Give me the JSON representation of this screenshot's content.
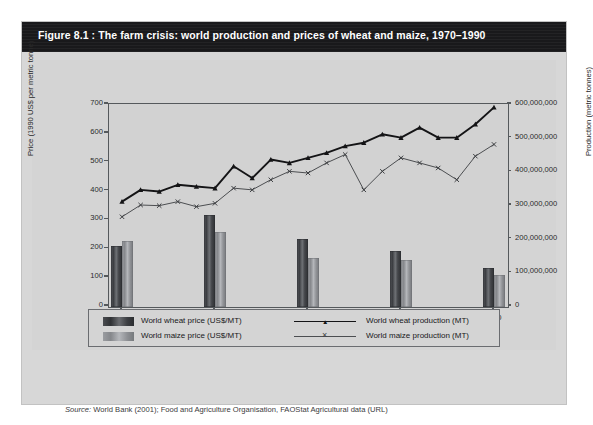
{
  "figure": {
    "number": "Figure 8.1 :",
    "caption": "The farm crisis: world production and prices of wheat and maize, 1970–1990",
    "source_label": "Source:",
    "source_text": "World Bank (2001); Food and Agriculture Organisation, FAOStat Agricultural data (URL)"
  },
  "legend": {
    "items": [
      {
        "label": "World wheat price (US$/MT)",
        "marker": "bar-dark",
        "color": "#3b3d41"
      },
      {
        "label": "World maize price (US$/MT)",
        "marker": "bar-light",
        "color": "#9b9da1"
      },
      {
        "label": "World wheat production (MT)",
        "marker": "line-triangle",
        "color": "#141416"
      },
      {
        "label": "World maize production (MT)",
        "marker": "line-x",
        "color": "#4c4e51"
      }
    ]
  },
  "chart_data": {
    "type": "bar",
    "title": "The farm crisis: world production and prices of wheat and maize, 1970–1990",
    "xlabel": "Year",
    "ylabel": "Price (1990 US$ per metric tonne)",
    "y2label": "Production (metric tonnes)",
    "xlim": [
      1969.3,
      1990.7
    ],
    "ylim": [
      0,
      700
    ],
    "y2lim": [
      0,
      600000000
    ],
    "yticks": [
      0,
      100,
      200,
      300,
      400,
      500,
      600,
      700
    ],
    "ytick_labels": [
      "0",
      "100",
      "200",
      "300",
      "400",
      "500",
      "600",
      "700"
    ],
    "y2ticks": [
      0,
      100000000,
      200000000,
      300000000,
      400000000,
      500000000,
      600000000
    ],
    "y2tick_labels": [
      "0",
      "100,000,000",
      "200,000,000",
      "300,000,000",
      "400,000,000",
      "500,000,000",
      "600,000,000"
    ],
    "xticks": [
      1970,
      1975,
      1980,
      1985,
      1990
    ],
    "xtick_labels": [
      "1970",
      "1975",
      "1980",
      "1985",
      "1990"
    ],
    "grid": false,
    "legend_position": "bottom",
    "bar_categories": [
      1970,
      1975,
      1980,
      1985,
      1990
    ],
    "series": [
      {
        "name": "World wheat price (US$/MT)",
        "axis": "left",
        "kind": "bar",
        "x": [
          1970,
          1975,
          1980,
          1985,
          1990
        ],
        "values": [
          213,
          318,
          237,
          195,
          135
        ]
      },
      {
        "name": "World maize price (US$/MT)",
        "axis": "left",
        "kind": "bar",
        "x": [
          1970,
          1975,
          1980,
          1985,
          1990
        ],
        "values": [
          228,
          261,
          170,
          163,
          112
        ]
      },
      {
        "name": "World wheat production (MT)",
        "axis": "right",
        "kind": "line",
        "x": [
          1970,
          1971,
          1972,
          1973,
          1974,
          1975,
          1976,
          1977,
          1978,
          1979,
          1980,
          1981,
          1982,
          1983,
          1984,
          1985,
          1986,
          1987,
          1988,
          1989,
          1990
        ],
        "values": [
          310000000,
          345000000,
          340000000,
          360000000,
          355000000,
          350000000,
          415000000,
          380000000,
          435000000,
          425000000,
          440000000,
          455000000,
          475000000,
          485000000,
          510000000,
          500000000,
          530000000,
          500000000,
          500000000,
          540000000,
          590000000
        ]
      },
      {
        "name": "World maize production (MT)",
        "axis": "right",
        "kind": "line",
        "x": [
          1970,
          1971,
          1972,
          1973,
          1974,
          1975,
          1976,
          1977,
          1978,
          1979,
          1980,
          1981,
          1982,
          1983,
          1984,
          1985,
          1986,
          1987,
          1988,
          1989,
          1990
        ],
        "values": [
          265000000,
          300000000,
          298000000,
          310000000,
          295000000,
          305000000,
          350000000,
          345000000,
          375000000,
          400000000,
          395000000,
          425000000,
          450000000,
          345000000,
          400000000,
          440000000,
          425000000,
          410000000,
          375000000,
          445000000,
          480000000
        ]
      }
    ]
  }
}
